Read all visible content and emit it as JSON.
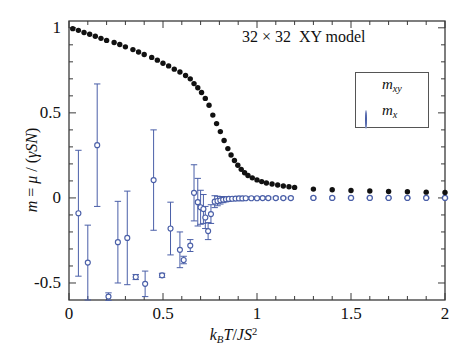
{
  "chart_data": {
    "type": "scatter",
    "title_parts": {
      "size": "32 × 32",
      "model": "XY model"
    },
    "xlabel": "k_B T/JS^2",
    "ylabel": "m = μ / (γSN)",
    "xlim": [
      0,
      2
    ],
    "ylim": [
      -0.6,
      1.04
    ],
    "xticks": [
      0,
      0.5,
      1,
      1.5,
      2
    ],
    "xtick_labels": [
      "0",
      "0.5",
      "1",
      "1.5",
      "2"
    ],
    "yticks": [
      -0.5,
      0,
      0.5,
      1
    ],
    "ytick_labels": [
      "-0.5",
      "0",
      "0.5",
      "1"
    ],
    "x_minor_tick_step": 0.1,
    "y_minor_tick_step": 0.1,
    "grid": false,
    "legend_position": "upper right inside",
    "series": [
      {
        "name": "m_xy",
        "label_base": "m",
        "label_sub": "xy",
        "marker": "filled-circle",
        "color": "#111111",
        "has_errorbars": false,
        "points": [
          {
            "x": 0.02,
            "y": 0.995
          },
          {
            "x": 0.05,
            "y": 0.985
          },
          {
            "x": 0.08,
            "y": 0.972
          },
          {
            "x": 0.11,
            "y": 0.962
          },
          {
            "x": 0.14,
            "y": 0.95
          },
          {
            "x": 0.17,
            "y": 0.938
          },
          {
            "x": 0.2,
            "y": 0.926
          },
          {
            "x": 0.24,
            "y": 0.914
          },
          {
            "x": 0.27,
            "y": 0.902
          },
          {
            "x": 0.3,
            "y": 0.888
          },
          {
            "x": 0.34,
            "y": 0.872
          },
          {
            "x": 0.37,
            "y": 0.858
          },
          {
            "x": 0.4,
            "y": 0.843
          },
          {
            "x": 0.44,
            "y": 0.826
          },
          {
            "x": 0.47,
            "y": 0.81
          },
          {
            "x": 0.5,
            "y": 0.792
          },
          {
            "x": 0.53,
            "y": 0.776
          },
          {
            "x": 0.56,
            "y": 0.757
          },
          {
            "x": 0.59,
            "y": 0.74
          },
          {
            "x": 0.62,
            "y": 0.72
          },
          {
            "x": 0.645,
            "y": 0.7
          },
          {
            "x": 0.665,
            "y": 0.672
          },
          {
            "x": 0.685,
            "y": 0.648
          },
          {
            "x": 0.705,
            "y": 0.62
          },
          {
            "x": 0.725,
            "y": 0.585
          },
          {
            "x": 0.745,
            "y": 0.545
          },
          {
            "x": 0.765,
            "y": 0.487
          },
          {
            "x": 0.785,
            "y": 0.437
          },
          {
            "x": 0.805,
            "y": 0.39
          },
          {
            "x": 0.825,
            "y": 0.338
          },
          {
            "x": 0.845,
            "y": 0.29
          },
          {
            "x": 0.862,
            "y": 0.252
          },
          {
            "x": 0.88,
            "y": 0.22
          },
          {
            "x": 0.898,
            "y": 0.192
          },
          {
            "x": 0.916,
            "y": 0.168
          },
          {
            "x": 0.934,
            "y": 0.148
          },
          {
            "x": 0.952,
            "y": 0.132
          },
          {
            "x": 0.975,
            "y": 0.118
          },
          {
            "x": 1.0,
            "y": 0.106
          },
          {
            "x": 1.025,
            "y": 0.096
          },
          {
            "x": 1.05,
            "y": 0.088
          },
          {
            "x": 1.08,
            "y": 0.082
          },
          {
            "x": 1.11,
            "y": 0.076
          },
          {
            "x": 1.14,
            "y": 0.07
          },
          {
            "x": 1.17,
            "y": 0.066
          },
          {
            "x": 1.2,
            "y": 0.062
          },
          {
            "x": 1.3,
            "y": 0.052
          },
          {
            "x": 1.4,
            "y": 0.048
          },
          {
            "x": 1.5,
            "y": 0.044
          },
          {
            "x": 1.6,
            "y": 0.041
          },
          {
            "x": 1.7,
            "y": 0.038
          },
          {
            "x": 1.8,
            "y": 0.036
          },
          {
            "x": 1.9,
            "y": 0.034
          },
          {
            "x": 2.0,
            "y": 0.032
          }
        ]
      },
      {
        "name": "m_x",
        "label_base": "m",
        "label_sub": "x",
        "marker": "open-circle",
        "color": "#4a5fa8",
        "has_errorbars": true,
        "points": [
          {
            "x": 0.05,
            "y": -0.09,
            "err": 0.37
          },
          {
            "x": 0.1,
            "y": -0.38,
            "err": 0.22
          },
          {
            "x": 0.15,
            "y": 0.31,
            "err": 0.36
          },
          {
            "x": 0.21,
            "y": -0.58,
            "err": 0.022
          },
          {
            "x": 0.26,
            "y": -0.26,
            "err": 0.24
          },
          {
            "x": 0.31,
            "y": -0.235,
            "err": 0.275
          },
          {
            "x": 0.355,
            "y": -0.465,
            "err": 0.015
          },
          {
            "x": 0.405,
            "y": -0.505,
            "err": 0.075
          },
          {
            "x": 0.45,
            "y": 0.105,
            "err": 0.295
          },
          {
            "x": 0.495,
            "y": -0.455,
            "err": 0.012
          },
          {
            "x": 0.54,
            "y": -0.18,
            "err": 0.155
          },
          {
            "x": 0.59,
            "y": -0.305,
            "err": 0.105
          },
          {
            "x": 0.61,
            "y": -0.365,
            "err": 0.022
          },
          {
            "x": 0.645,
            "y": -0.28,
            "err": 0.035
          },
          {
            "x": 0.665,
            "y": 0.03,
            "err": 0.165
          },
          {
            "x": 0.685,
            "y": -0.025,
            "err": 0.14
          },
          {
            "x": 0.7,
            "y": -0.055,
            "err": 0.1
          },
          {
            "x": 0.715,
            "y": -0.065,
            "err": 0.085
          },
          {
            "x": 0.725,
            "y": -0.115,
            "err": 0.065
          },
          {
            "x": 0.74,
            "y": -0.195,
            "err": 0.05
          },
          {
            "x": 0.755,
            "y": -0.095,
            "err": 0.055
          },
          {
            "x": 0.775,
            "y": -0.022,
            "err": 0.035
          },
          {
            "x": 0.79,
            "y": -0.018,
            "err": 0.028
          },
          {
            "x": 0.805,
            "y": -0.014,
            "err": 0.022
          },
          {
            "x": 0.82,
            "y": -0.01,
            "err": 0.018
          },
          {
            "x": 0.835,
            "y": -0.008,
            "err": 0.015
          },
          {
            "x": 0.85,
            "y": -0.006,
            "err": 0.013
          },
          {
            "x": 0.868,
            "y": -0.005,
            "err": 0.011
          },
          {
            "x": 0.886,
            "y": -0.004,
            "err": 0.01
          },
          {
            "x": 0.904,
            "y": -0.003,
            "err": 0.009
          },
          {
            "x": 0.922,
            "y": -0.003,
            "err": 0.008
          },
          {
            "x": 0.94,
            "y": -0.002,
            "err": 0.008
          },
          {
            "x": 0.97,
            "y": -0.002,
            "err": 0.007
          },
          {
            "x": 1.0,
            "y": -0.002,
            "err": 0.007
          },
          {
            "x": 1.03,
            "y": -0.001,
            "err": 0.006
          },
          {
            "x": 1.06,
            "y": -0.001,
            "err": 0.006
          },
          {
            "x": 1.1,
            "y": -0.001,
            "err": 0.006
          },
          {
            "x": 1.14,
            "y": -0.001,
            "err": 0.005
          },
          {
            "x": 1.18,
            "y": -0.001,
            "err": 0.005
          },
          {
            "x": 1.3,
            "y": 0.0,
            "err": 0.005
          },
          {
            "x": 1.4,
            "y": 0.0,
            "err": 0.005
          },
          {
            "x": 1.5,
            "y": 0.0,
            "err": 0.004
          },
          {
            "x": 1.6,
            "y": 0.0,
            "err": 0.004
          },
          {
            "x": 1.7,
            "y": 0.0,
            "err": 0.004
          },
          {
            "x": 1.8,
            "y": 0.0,
            "err": 0.004
          },
          {
            "x": 1.9,
            "y": 0.0,
            "err": 0.004
          },
          {
            "x": 2.0,
            "y": 0.0,
            "err": 0.004
          }
        ]
      }
    ]
  },
  "colors": {
    "axis": "#3a3a3a",
    "series_black": "#111111",
    "series_blue": "#4a5fa8",
    "background": "#ffffff"
  }
}
